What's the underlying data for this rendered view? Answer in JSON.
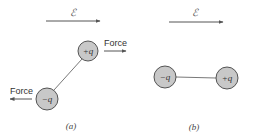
{
  "colors": {
    "circle_fill": "#c8c8c8",
    "circle_stroke": "#444444",
    "line": "#555555",
    "arrow": "#555555",
    "text": "#333333"
  },
  "panels": [
    {
      "caption": "(a)",
      "field_label": "ℰ",
      "field_arrow": {
        "x1": 46,
        "y1": 21,
        "x2": 100,
        "y2": 21
      },
      "charges": [
        {
          "label": "+q",
          "cx": 88,
          "cy": 51,
          "r": 10
        },
        {
          "label": "−q",
          "cx": 47,
          "cy": 99,
          "r": 11
        }
      ],
      "forces": [
        {
          "label": "Force",
          "direction": "right",
          "x1": 104,
          "y1": 51,
          "x2": 126,
          "y2": 51,
          "label_x": 104,
          "label_y": 46
        },
        {
          "label": "Force",
          "direction": "left",
          "x1": 32,
          "y1": 99,
          "x2": 10,
          "y2": 99,
          "label_x": 10,
          "label_y": 94
        }
      ]
    },
    {
      "caption": "(b)",
      "field_label": "ℰ",
      "field_arrow": {
        "x1": 169,
        "y1": 22,
        "x2": 223,
        "y2": 22
      },
      "charges": [
        {
          "label": "−q",
          "cx": 165,
          "cy": 77,
          "r": 11
        },
        {
          "label": "+q",
          "cx": 227,
          "cy": 78,
          "r": 11
        }
      ],
      "forces": []
    }
  ]
}
